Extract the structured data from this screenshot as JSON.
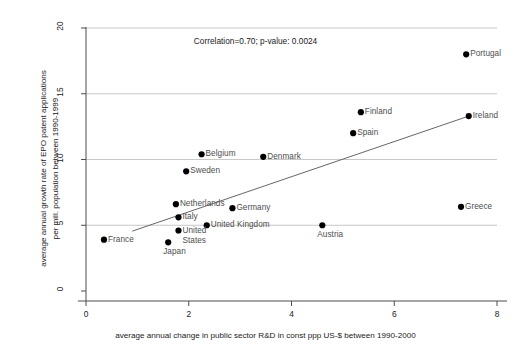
{
  "chart_data": {
    "type": "scatter",
    "title": "",
    "xlabel": "average annual change in public sector R&D in const ppp US-$ between 1990-2000",
    "ylabel": "average annual growth rate of EPO patent applications\nper mill. population between 1990-1999",
    "xlim": [
      -0.35,
      8.4
    ],
    "ylim": [
      -0.6,
      21.2
    ],
    "xticks": [
      0,
      2,
      4,
      6,
      8
    ],
    "xticklabels": [
      "0",
      "2",
      "4",
      "6",
      "8"
    ],
    "yticks": [
      0,
      5,
      10,
      15,
      20
    ],
    "yticklabels": [
      "0",
      "5",
      "10",
      "15",
      "20"
    ],
    "grid": "horizontal",
    "grid_color": "#b0b0b0",
    "legend": "none",
    "marker_color": "#000000",
    "label_color": "#4d4d4d",
    "trendline": {
      "color": "#666666",
      "x": [
        0.9,
        7.45
      ],
      "y": [
        4.55,
        13.3
      ]
    },
    "annotations": [
      {
        "name": "correlation-annotation",
        "text": "Correlation=0.70; p-value: 0.0024",
        "x": 3.3,
        "y": 19.0
      }
    ],
    "points": [
      {
        "name": "Portugal",
        "x": 7.4,
        "y": 18.0,
        "label_pos": "right"
      },
      {
        "name": "Finland",
        "x": 5.35,
        "y": 13.6,
        "label_pos": "right"
      },
      {
        "name": "Ireland",
        "x": 7.45,
        "y": 13.3,
        "label_pos": "right"
      },
      {
        "name": "Spain",
        "x": 5.2,
        "y": 12.0,
        "label_pos": "right"
      },
      {
        "name": "Belgium",
        "x": 2.25,
        "y": 10.4,
        "label_pos": "right"
      },
      {
        "name": "Denmark",
        "x": 3.45,
        "y": 10.2,
        "label_pos": "right"
      },
      {
        "name": "Sweden",
        "x": 1.95,
        "y": 9.1,
        "label_pos": "right"
      },
      {
        "name": "Netherlands",
        "x": 1.75,
        "y": 6.6,
        "label_pos": "right"
      },
      {
        "name": "Greece",
        "x": 7.3,
        "y": 6.4,
        "label_pos": "right"
      },
      {
        "name": "Germany",
        "x": 2.85,
        "y": 6.3,
        "label_pos": "right"
      },
      {
        "name": "Italy",
        "x": 1.8,
        "y": 5.6,
        "label_pos": "right"
      },
      {
        "name": "United Kingdom",
        "x": 2.35,
        "y": 5.0,
        "label_pos": "right"
      },
      {
        "name": "Austria",
        "x": 4.6,
        "y": 5.0,
        "label_pos": "below"
      },
      {
        "name": "United States",
        "x": 1.8,
        "y": 4.6,
        "label_pos": "right-two-line"
      },
      {
        "name": "France",
        "x": 0.35,
        "y": 3.9,
        "label_pos": "right"
      },
      {
        "name": "Japan",
        "x": 1.6,
        "y": 3.7,
        "label_pos": "below"
      }
    ]
  }
}
